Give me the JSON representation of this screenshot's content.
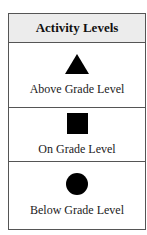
{
  "table": {
    "header": "Activity Levels",
    "rows": [
      {
        "icon": "triangle-icon",
        "label": "Above Grade Level"
      },
      {
        "icon": "square-icon",
        "label": "On Grade Level"
      },
      {
        "icon": "circle-icon",
        "label": "Below Grade Level"
      }
    ]
  }
}
